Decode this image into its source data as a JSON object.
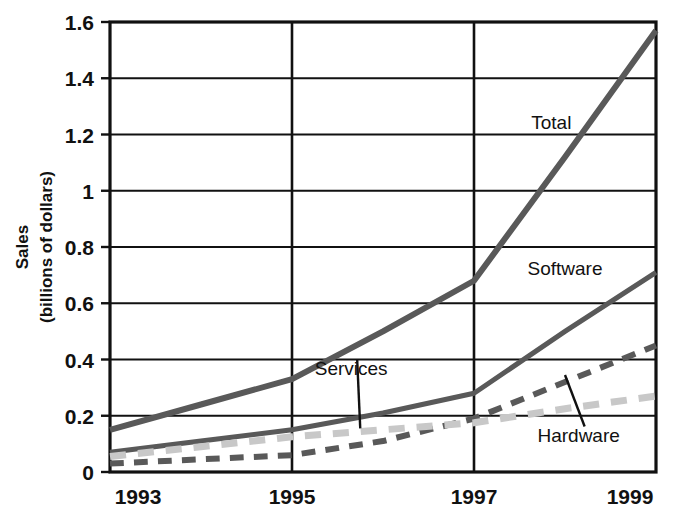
{
  "chart_data": {
    "type": "line",
    "title": "",
    "xlabel": "",
    "ylabel": "Sales (billions of dollars)",
    "ylabel_line1": "Sales",
    "ylabel_line2": "(billions of dollars)",
    "x": [
      1993,
      1994,
      1995,
      1996,
      1997,
      1998,
      1999
    ],
    "xtick_labels": [
      "1993",
      "1995",
      "1997",
      "1999"
    ],
    "xtick_values": [
      1993,
      1995,
      1997,
      1999
    ],
    "ytick_labels": [
      "0",
      "0.2",
      "0.4",
      "0.6",
      "0.8",
      "1",
      "1.2",
      "1.4",
      "1.6"
    ],
    "ytick_values": [
      0,
      0.2,
      0.4,
      0.6,
      0.8,
      1,
      1.2,
      1.4,
      1.6
    ],
    "xlim": [
      1993,
      1999
    ],
    "ylim": [
      0,
      1.6
    ],
    "grid": true,
    "grid_horizontal": true,
    "grid_vertical_at": [
      1995,
      1997
    ],
    "legend": "inline-labels",
    "series": [
      {
        "name": "Total",
        "style": "solid",
        "color": "#595959",
        "width": 6,
        "label_x": 1997.85,
        "label_y": 1.22,
        "leader": false,
        "values": [
          0.15,
          0.24,
          0.33,
          0.5,
          0.68,
          1.12,
          1.57
        ]
      },
      {
        "name": "Software",
        "style": "solid",
        "color": "#595959",
        "width": 5,
        "label_x": 1998.0,
        "label_y": 0.7,
        "leader": false,
        "values": [
          0.07,
          0.11,
          0.15,
          0.21,
          0.28,
          0.5,
          0.71
        ]
      },
      {
        "name": "Hardware",
        "style": "dashed",
        "color": "#595959",
        "width": 6,
        "label_x": 1998.15,
        "label_y": 0.105,
        "leader": true,
        "leader_to_x": 1998.0,
        "leader_to_y": 0.345,
        "values": [
          0.03,
          0.045,
          0.06,
          0.11,
          0.19,
          0.32,
          0.45
        ]
      },
      {
        "name": "Services",
        "style": "dashed",
        "color": "#c8c8c8",
        "width": 7,
        "label_x": 1995.65,
        "label_y": 0.345,
        "leader": true,
        "leader_to_x": 1995.75,
        "leader_to_y": 0.155,
        "values": [
          0.055,
          0.09,
          0.125,
          0.15,
          0.175,
          0.225,
          0.27
        ]
      }
    ]
  },
  "plot_geometry": {
    "left": 110,
    "right": 656,
    "top": 22,
    "bottom": 472
  }
}
